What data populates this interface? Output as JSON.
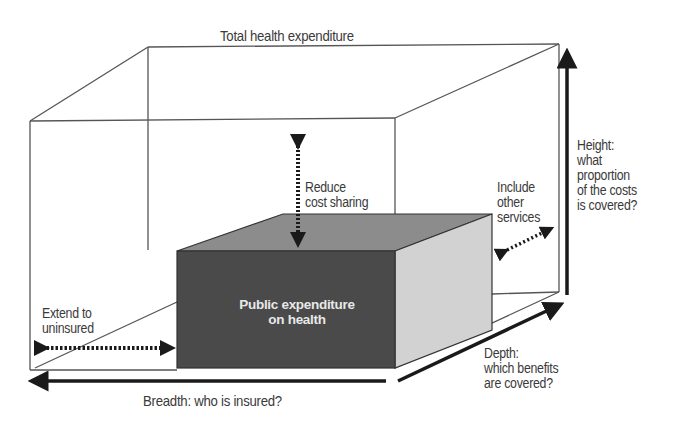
{
  "diagram": {
    "title": "Total health expenditure",
    "inner_box": {
      "label_line1": "Public expenditure",
      "label_line2": "on health",
      "colors": {
        "front": "#4a4a4a",
        "top": "#8c8c8c",
        "side": "#d2d2d2"
      }
    },
    "annotations": {
      "reduce_cost_sharing": {
        "line1": "Reduce",
        "line2": "cost sharing"
      },
      "include_other_services": {
        "line1": "Include",
        "line2": "other",
        "line3": "services"
      },
      "extend_to_uninsured": {
        "line1": "Extend to",
        "line2": "uninsured"
      }
    },
    "axes": {
      "breadth": {
        "label": "Breadth: who is insured?"
      },
      "depth": {
        "line1": "Depth:",
        "line2": "which benefits",
        "line3": "are covered?"
      },
      "height": {
        "line1": "Height:",
        "line2": "what",
        "line3": "proportion",
        "line4": "of the costs",
        "line5": "is covered?"
      }
    },
    "colors": {
      "line": "#555555",
      "arrow": "#1a1a1a",
      "text": "#3a3a3a"
    }
  }
}
